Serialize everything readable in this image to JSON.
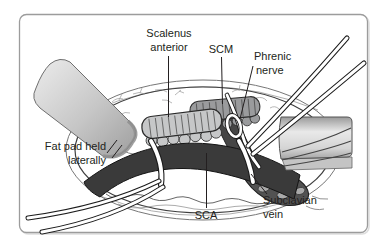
{
  "figure": {
    "type": "surgical-anatomy-illustration",
    "labels": {
      "scalenus_anterior_line1": "Scalenus",
      "scalenus_anterior_line2": "anterior",
      "scm": "SCM",
      "phrenic_line1": "Phrenic",
      "phrenic_line2": "nerve",
      "fat_pad_line1": "Fat pad held",
      "fat_pad_line2": "laterally",
      "sca": "SCA",
      "subclavian_line1": "Subclavian",
      "subclavian_line2": "vein"
    },
    "colors": {
      "artery": "#3a3a3a",
      "vein": "#525252",
      "vein_highlight": "#a9a9a9",
      "muscle_light": "#c6c7c8",
      "muscle_dark": "#9a9b9d",
      "outline": "#231f20",
      "frame_border": "#9c9c9c",
      "loop_white": "#ffffff"
    }
  }
}
